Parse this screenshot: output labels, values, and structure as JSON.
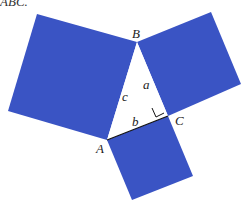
{
  "caption_fragment": "ABC.",
  "colors": {
    "square_fill": "#3a54c4",
    "triangle_fill": "#ffffff",
    "edge": "#111111"
  },
  "vertices": {
    "A": "A",
    "B": "B",
    "C": "C"
  },
  "sides": {
    "a": "a",
    "b": "b",
    "c": "c"
  },
  "figure": {
    "right_angle_at": "C"
  }
}
